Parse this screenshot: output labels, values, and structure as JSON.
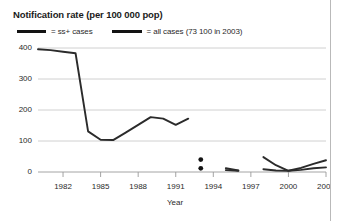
{
  "chart_data": {
    "type": "line",
    "title": "Notification rate (per 100 000 pop)",
    "xlabel": "Year",
    "ylabel": "",
    "ylim": [
      0,
      400
    ],
    "xlim": [
      1980,
      2003
    ],
    "yticks": [
      0,
      100,
      200,
      300,
      400
    ],
    "xticks": [
      1982,
      1985,
      1988,
      1991,
      1994,
      1997,
      2000,
      2003
    ],
    "grid": true,
    "legend_position": "top-left",
    "legend": [
      {
        "label": "= ss+ cases",
        "color": "#131313"
      },
      {
        "label": "= all cases (73 100 in 2003)",
        "color": "#131313"
      }
    ],
    "series": [
      {
        "name": "all cases",
        "color": "#2b2b2b",
        "points": [
          {
            "x": 1980,
            "y": 396
          },
          {
            "x": 1981,
            "y": 393
          },
          {
            "x": 1982,
            "y": 388
          },
          {
            "x": 1983,
            "y": 383
          },
          {
            "x": 1984,
            "y": 131
          },
          {
            "x": 1985,
            "y": 104
          },
          {
            "x": 1986,
            "y": 103
          },
          {
            "x": 1987,
            "y": 127
          },
          {
            "x": 1988,
            "y": 152
          },
          {
            "x": 1989,
            "y": 177
          },
          {
            "x": 1990,
            "y": 172
          },
          {
            "x": 1991,
            "y": 152
          },
          {
            "x": 1992,
            "y": 172
          }
        ]
      },
      {
        "name": "all cases segment 2",
        "color": "#2b2b2b",
        "points": [
          {
            "x": 1995,
            "y": 12
          },
          {
            "x": 1996,
            "y": 5
          }
        ]
      },
      {
        "name": "all cases segment 3",
        "color": "#2b2b2b",
        "points": [
          {
            "x": 1998,
            "y": 48
          },
          {
            "x": 1999,
            "y": 22
          },
          {
            "x": 2000,
            "y": 4
          },
          {
            "x": 2001,
            "y": 13
          },
          {
            "x": 2002,
            "y": 26
          },
          {
            "x": 2003,
            "y": 38
          }
        ]
      },
      {
        "name": "ss+ cases segment",
        "color": "#2b2b2b",
        "points": [
          {
            "x": 1995,
            "y": 6
          },
          {
            "x": 1996,
            "y": 4
          }
        ]
      },
      {
        "name": "ss+ cases segment 3",
        "color": "#2b2b2b",
        "points": [
          {
            "x": 1998,
            "y": 9
          },
          {
            "x": 1999,
            "y": 5
          },
          {
            "x": 2000,
            "y": 4
          },
          {
            "x": 2001,
            "y": 7
          },
          {
            "x": 2002,
            "y": 12
          },
          {
            "x": 2003,
            "y": 15
          }
        ]
      }
    ],
    "markers": [
      {
        "x": 1993,
        "y": 40,
        "color": "#131313"
      },
      {
        "x": 1993,
        "y": 12,
        "color": "#131313"
      }
    ]
  }
}
